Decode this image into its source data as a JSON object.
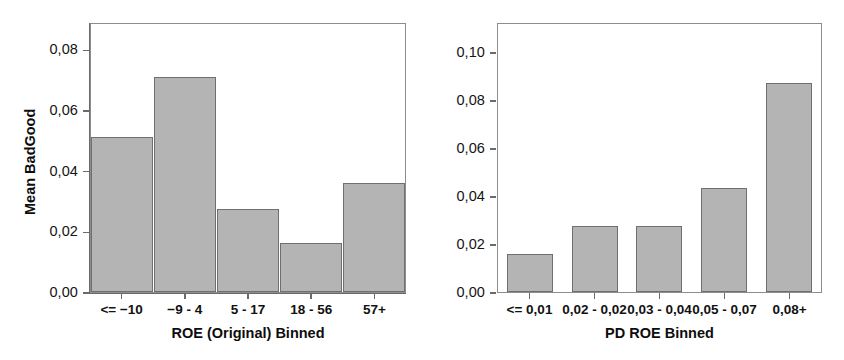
{
  "figure": {
    "background": "#ffffff",
    "bar_fill": "#b4b4b4",
    "bar_edge": "#6f6f6f",
    "axis_color": "#6a6a6a"
  },
  "chart_data": [
    {
      "type": "bar",
      "title": "",
      "xlabel": "ROE (Original) Binned",
      "ylabel": "Mean BadGood",
      "categories": [
        "<= −10",
        "−9 - 4",
        "5 - 17",
        "18 - 56",
        "57+"
      ],
      "values": [
        0.051,
        0.071,
        0.0275,
        0.016,
        0.036
      ],
      "ylim": [
        0.0,
        0.089
      ],
      "yticks": [
        0.0,
        0.02,
        0.04,
        0.06,
        0.08
      ],
      "ytick_labels": [
        "0,00",
        "0,02",
        "0,04",
        "0,06",
        "0,08"
      ],
      "grid": false,
      "legend": "none",
      "decimal_separator": ","
    },
    {
      "type": "bar",
      "title": "",
      "xlabel": "PD ROE Binned",
      "ylabel": "Mean BadGood",
      "categories": [
        "<= 0,01",
        "0,02 - 0,02",
        "0,03 - 0,04",
        "0,05 - 0,07",
        "0,08+"
      ],
      "values": [
        0.016,
        0.0275,
        0.0275,
        0.0435,
        0.087
      ],
      "ylim": [
        0.0,
        0.1125
      ],
      "yticks": [
        0.0,
        0.02,
        0.04,
        0.06,
        0.08,
        0.1
      ],
      "ytick_labels": [
        "0,00",
        "0,02",
        "0,04",
        "0,06",
        "0,08",
        "0,10"
      ],
      "grid": false,
      "legend": "none",
      "decimal_separator": ","
    }
  ]
}
